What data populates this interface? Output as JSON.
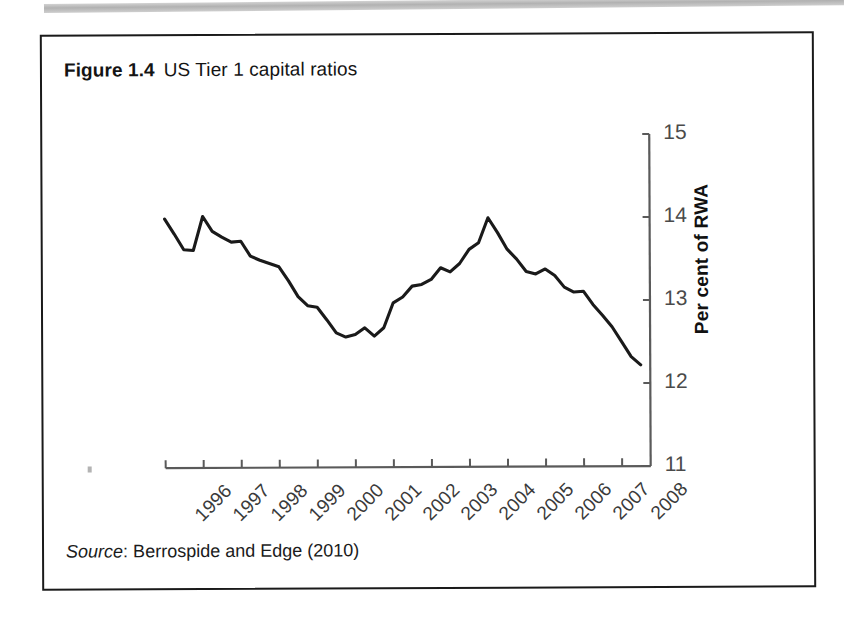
{
  "figure": {
    "label": "Figure 1.4",
    "caption": "US Tier 1 capital ratios",
    "source_word": "Source",
    "source_text": ": Berrospide and Edge (2010)"
  },
  "colors": {
    "line": "#1a1a1a",
    "axis": "#5a5a5a",
    "tick_label": "#4a4a4a",
    "border": "#1a1a1a",
    "background": "#ffffff"
  },
  "chart_data": {
    "type": "line",
    "title": "US Tier 1 capital ratios",
    "xlabel": "",
    "ylabel": "Per cent of RWA",
    "ylim": [
      11,
      15
    ],
    "yticks": [
      11,
      12,
      13,
      14,
      15
    ],
    "ytick_labels": [
      "11",
      "12",
      "13",
      "14",
      "15"
    ],
    "y_axis_position": "right",
    "xlim": [
      1996,
      2008.75
    ],
    "xticks": [
      1996,
      1997,
      1998,
      1999,
      2000,
      2001,
      2002,
      2003,
      2004,
      2005,
      2006,
      2007,
      2008
    ],
    "xtick_labels": [
      "1996",
      "1997",
      "1998",
      "1999",
      "2000",
      "2001",
      "2002",
      "2003",
      "2004",
      "2005",
      "2006",
      "2007",
      "2008"
    ],
    "xtick_rotation": -45,
    "grid": false,
    "legend": false,
    "series": [
      {
        "name": "US Tier 1 capital ratio",
        "x": [
          1996.0,
          1996.25,
          1996.5,
          1996.75,
          1997.0,
          1997.25,
          1997.5,
          1997.75,
          1998.0,
          1998.25,
          1998.5,
          1998.75,
          1999.0,
          1999.25,
          1999.5,
          1999.75,
          2000.0,
          2000.25,
          2000.5,
          2000.75,
          2001.0,
          2001.25,
          2001.5,
          2001.75,
          2002.0,
          2002.25,
          2002.5,
          2002.75,
          2003.0,
          2003.25,
          2003.5,
          2003.75,
          2004.0,
          2004.25,
          2004.5,
          2004.75,
          2005.0,
          2005.25,
          2005.5,
          2005.75,
          2006.0,
          2006.25,
          2006.5,
          2006.75,
          2007.0,
          2007.25,
          2007.5,
          2007.75,
          2008.0,
          2008.25,
          2008.5
        ],
        "values": [
          14.0,
          13.82,
          13.63,
          13.62,
          14.03,
          13.85,
          13.78,
          13.72,
          13.73,
          13.55,
          13.5,
          13.46,
          13.42,
          13.25,
          13.06,
          12.95,
          12.93,
          12.78,
          12.62,
          12.57,
          12.6,
          12.68,
          12.58,
          12.68,
          12.98,
          13.05,
          13.18,
          13.2,
          13.26,
          13.4,
          13.35,
          13.45,
          13.62,
          13.7,
          14.0,
          13.82,
          13.62,
          13.5,
          13.35,
          13.32,
          13.38,
          13.3,
          13.16,
          13.1,
          13.11,
          12.95,
          12.82,
          12.68,
          12.5,
          12.32,
          12.22
        ]
      }
    ]
  },
  "axis_geometry": {
    "plot_left_px": 122,
    "plot_right_px": 607,
    "plot_top_px": 100,
    "plot_bottom_px": 432,
    "x_first_year": 1996,
    "x_last_year": 2008.75,
    "y_min": 11,
    "y_max": 15
  }
}
